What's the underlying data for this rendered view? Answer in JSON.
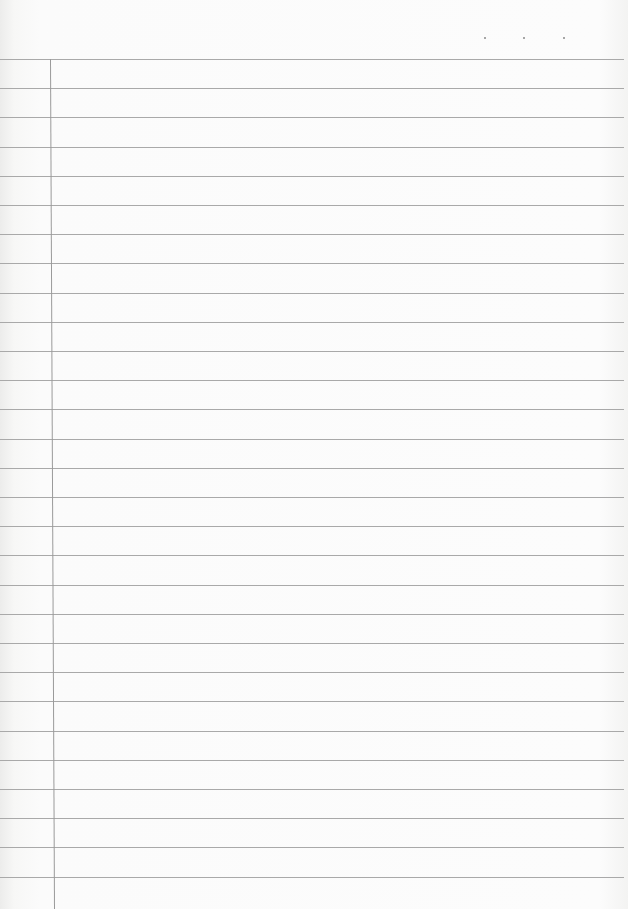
{
  "page": {
    "type": "lined-notebook-paper",
    "content_text": "",
    "header_dots": [
      {
        "x": 484,
        "y": 37
      },
      {
        "x": 523,
        "y": 37
      },
      {
        "x": 563,
        "y": 37
      }
    ],
    "rules": {
      "first_y": 59,
      "spacing": 29.2,
      "count": 29,
      "color": "#a9a9a9"
    },
    "margin_line": {
      "x_top": 50,
      "x_bottom": 54,
      "top_y": 59,
      "color": "#9a9a9a"
    }
  }
}
